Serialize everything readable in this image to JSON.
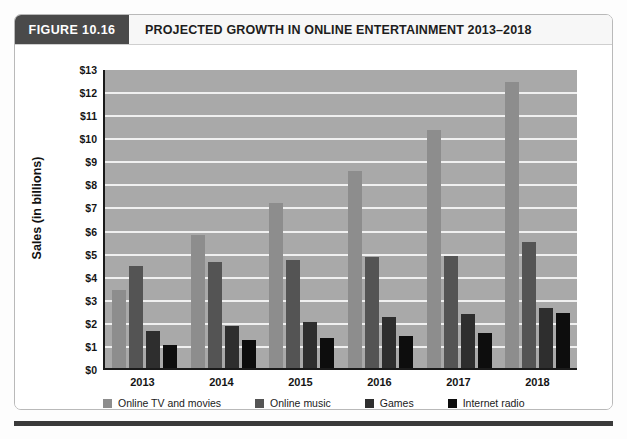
{
  "figure": {
    "tag": "FIGURE 10.16",
    "title": "PROJECTED GROWTH IN ONLINE ENTERTAINMENT 2013–2018"
  },
  "chart_data": {
    "type": "bar",
    "title": "PROJECTED GROWTH IN ONLINE ENTERTAINMENT 2013–2018",
    "xlabel": "",
    "ylabel": "Sales (in billions)",
    "categories": [
      "2013",
      "2014",
      "2015",
      "2016",
      "2017",
      "2018"
    ],
    "ylim": [
      0,
      13
    ],
    "ytick_step": 1,
    "ytick_labels": [
      "$0",
      "$1",
      "$2",
      "$3",
      "$4",
      "$5",
      "$6",
      "$7",
      "$8",
      "$9",
      "$10",
      "$11",
      "$12",
      "$13"
    ],
    "grid": true,
    "legend_position": "bottom",
    "plot_background": "#a9a9a9",
    "series": [
      {
        "name": "Online TV and movies",
        "color": "#8d8d8d",
        "values": [
          3.4,
          5.75,
          7.15,
          8.55,
          10.3,
          12.4
        ]
      },
      {
        "name": "Online music",
        "color": "#545454",
        "values": [
          4.4,
          4.6,
          4.7,
          4.8,
          4.85,
          5.45
        ]
      },
      {
        "name": "Games",
        "color": "#2e2e2e",
        "values": [
          1.6,
          1.8,
          2.0,
          2.2,
          2.35,
          2.6
        ]
      },
      {
        "name": "Internet radio",
        "color": "#0d0d0d",
        "values": [
          1.0,
          1.2,
          1.3,
          1.4,
          1.5,
          2.4
        ]
      }
    ]
  }
}
